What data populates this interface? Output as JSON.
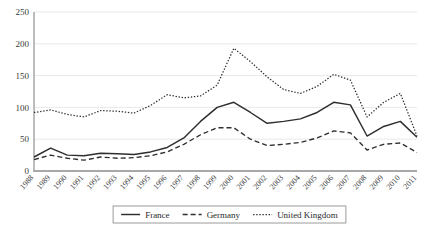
{
  "chart_data": {
    "type": "line",
    "title": "",
    "subtitle": "",
    "xlabel": "",
    "ylabel": "",
    "ylim": [
      0,
      250
    ],
    "yticks": [
      0,
      50,
      100,
      150,
      200,
      250
    ],
    "grid": true,
    "legend_position": "bottom",
    "categories": [
      "1988",
      "1989",
      "1990",
      "1991",
      "1992",
      "1993",
      "1994",
      "1995",
      "1996",
      "1997",
      "1998",
      "1999",
      "2000",
      "2001",
      "2002",
      "2003",
      "2004",
      "2005",
      "2006",
      "2007",
      "2008",
      "2009",
      "2010",
      "2011"
    ],
    "series": [
      {
        "name": "France",
        "style": "solid",
        "color": "#2e2e2e",
        "values": [
          22,
          36,
          25,
          24,
          28,
          27,
          26,
          30,
          37,
          52,
          78,
          100,
          108,
          92,
          75,
          78,
          82,
          92,
          108,
          104,
          55,
          70,
          78,
          53
        ]
      },
      {
        "name": "Germany",
        "style": "dashed",
        "color": "#2e2e2e",
        "values": [
          18,
          25,
          20,
          17,
          22,
          20,
          21,
          24,
          30,
          42,
          57,
          68,
          68,
          50,
          40,
          42,
          45,
          52,
          63,
          60,
          33,
          42,
          44,
          29
        ]
      },
      {
        "name": "United Kingdom",
        "style": "dotted",
        "color": "#2e2e2e",
        "values": [
          92,
          96,
          89,
          85,
          95,
          94,
          91,
          103,
          120,
          115,
          118,
          135,
          193,
          172,
          148,
          128,
          122,
          133,
          152,
          143,
          85,
          108,
          122,
          55
        ]
      }
    ]
  },
  "legend": {
    "items": [
      {
        "label": "France",
        "style": "solid"
      },
      {
        "label": "Germany",
        "style": "dashed"
      },
      {
        "label": "United Kingdom",
        "style": "dotted"
      }
    ]
  }
}
